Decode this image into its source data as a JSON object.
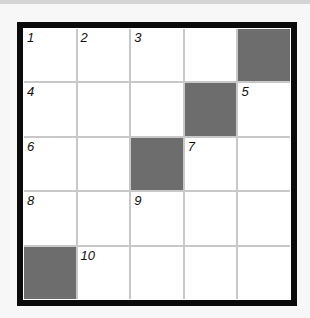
{
  "puzzle": {
    "rows": 5,
    "cols": 5,
    "colors": {
      "frame": "#0a0a0a",
      "gridline": "#c8c8c8",
      "block": "#6d6d6d",
      "cell": "#ffffff",
      "page": "#f7f7f7"
    },
    "cells": [
      {
        "r": 0,
        "c": 0,
        "block": false,
        "num": "1"
      },
      {
        "r": 0,
        "c": 1,
        "block": false,
        "num": "2"
      },
      {
        "r": 0,
        "c": 2,
        "block": false,
        "num": "3"
      },
      {
        "r": 0,
        "c": 3,
        "block": false,
        "num": ""
      },
      {
        "r": 0,
        "c": 4,
        "block": true,
        "num": ""
      },
      {
        "r": 1,
        "c": 0,
        "block": false,
        "num": "4"
      },
      {
        "r": 1,
        "c": 1,
        "block": false,
        "num": ""
      },
      {
        "r": 1,
        "c": 2,
        "block": false,
        "num": ""
      },
      {
        "r": 1,
        "c": 3,
        "block": true,
        "num": ""
      },
      {
        "r": 1,
        "c": 4,
        "block": false,
        "num": "5"
      },
      {
        "r": 2,
        "c": 0,
        "block": false,
        "num": "6"
      },
      {
        "r": 2,
        "c": 1,
        "block": false,
        "num": ""
      },
      {
        "r": 2,
        "c": 2,
        "block": true,
        "num": ""
      },
      {
        "r": 2,
        "c": 3,
        "block": false,
        "num": "7"
      },
      {
        "r": 2,
        "c": 4,
        "block": false,
        "num": ""
      },
      {
        "r": 3,
        "c": 0,
        "block": false,
        "num": "8"
      },
      {
        "r": 3,
        "c": 1,
        "block": false,
        "num": ""
      },
      {
        "r": 3,
        "c": 2,
        "block": false,
        "num": "9"
      },
      {
        "r": 3,
        "c": 3,
        "block": false,
        "num": ""
      },
      {
        "r": 3,
        "c": 4,
        "block": false,
        "num": ""
      },
      {
        "r": 4,
        "c": 0,
        "block": true,
        "num": ""
      },
      {
        "r": 4,
        "c": 1,
        "block": false,
        "num": "10"
      },
      {
        "r": 4,
        "c": 2,
        "block": false,
        "num": ""
      },
      {
        "r": 4,
        "c": 3,
        "block": false,
        "num": ""
      },
      {
        "r": 4,
        "c": 4,
        "block": false,
        "num": ""
      }
    ]
  }
}
